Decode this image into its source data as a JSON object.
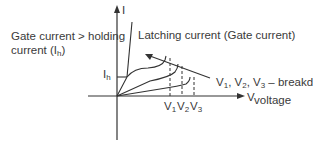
{
  "diagram": {
    "axes": {
      "y_label": "I",
      "x_label": "V"
    },
    "annotations": {
      "gate_line1": "Gate current > holding",
      "gate_line2": "current (I",
      "gate_sub": "h",
      "gate_close": ")",
      "latching": "Latching current (Gate current)",
      "ih_main": "I",
      "ih_sub": "h",
      "breakdown_line1_parts": [
        "V",
        "1",
        ", V",
        "2",
        ", V",
        "3",
        " – breakdown"
      ],
      "breakdown_line2": "voltage"
    },
    "ticks": [
      {
        "main": "V",
        "sub": "1"
      },
      {
        "main": "V",
        "sub": "2"
      },
      {
        "main": "V",
        "sub": "3"
      }
    ],
    "line_color": "#333333"
  }
}
